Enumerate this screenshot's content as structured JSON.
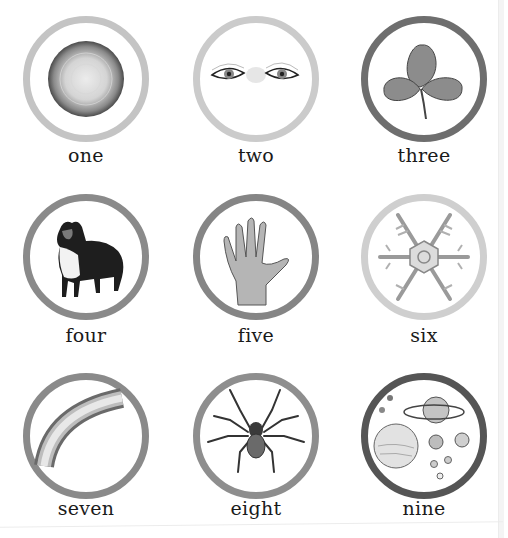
{
  "grid": {
    "items": [
      {
        "number": 1,
        "label": "one",
        "image": "sun-disc-icon",
        "ring_color": "#c4c4c4"
      },
      {
        "number": 2,
        "label": "two",
        "image": "eyes-icon",
        "ring_color": "#cbcbcb"
      },
      {
        "number": 3,
        "label": "three",
        "image": "clover-icon",
        "ring_color": "#6e6e6e"
      },
      {
        "number": 4,
        "label": "four",
        "image": "dog-icon",
        "ring_color": "#8a8a8a"
      },
      {
        "number": 5,
        "label": "five",
        "image": "hand-icon",
        "ring_color": "#858585"
      },
      {
        "number": 6,
        "label": "six",
        "image": "snowflake-icon",
        "ring_color": "#cfcfcf"
      },
      {
        "number": 7,
        "label": "seven",
        "image": "rainbow-icon",
        "ring_color": "#8a8a8a"
      },
      {
        "number": 8,
        "label": "eight",
        "image": "spider-icon",
        "ring_color": "#8e8e8e"
      },
      {
        "number": 9,
        "label": "nine",
        "image": "planets-icon",
        "ring_color": "#555555"
      }
    ]
  }
}
